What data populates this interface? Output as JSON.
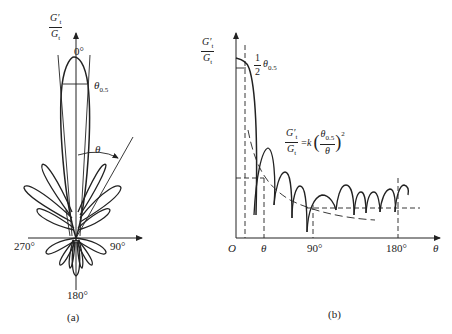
{
  "panel_a": {
    "ylabel_num": "G′",
    "ylabel_num_sub": "t",
    "ylabel_den": "G",
    "ylabel_den_sub": "t",
    "angle_top": "0°",
    "beamwidth_label": "θ",
    "beamwidth_sub": "0.5",
    "theta_label": "θ",
    "angle_left": "270°",
    "angle_right": "90°",
    "angle_bottom": "180°",
    "caption": "(a)"
  },
  "panel_b": {
    "ylabel_num": "G′",
    "ylabel_num_sub": "t",
    "ylabel_den": "G",
    "ylabel_den_sub": "t",
    "half_beam_num": "1",
    "half_beam_den": "2",
    "half_beam_theta": "θ",
    "half_beam_sub": "0.5",
    "formula_lhs_num": "G′",
    "formula_lhs_den": "G",
    "formula_sub": "t",
    "formula_eq": "=k",
    "formula_inner_num": "θ",
    "formula_inner_num_sub": "0.5",
    "formula_inner_den": "θ",
    "formula_exp": "2",
    "x_origin": "O",
    "x_tick_theta": "θ",
    "x_tick_90": "90°",
    "x_tick_180": "180°",
    "x_axis_label": "θ",
    "caption": "(b)"
  },
  "colors": {
    "stroke": "#222222",
    "background": "#ffffff"
  }
}
